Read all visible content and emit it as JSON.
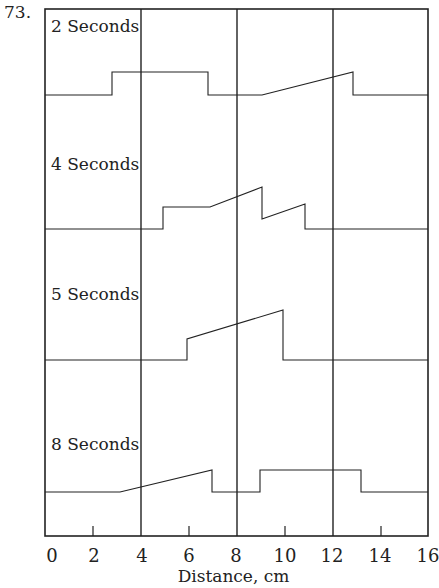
{
  "problem_number": "73.",
  "snapshots": [
    {
      "label": "2 Seconds",
      "baseline_y": 95
    },
    {
      "label": "4 Seconds",
      "baseline_y": 229
    },
    {
      "label": "5 Seconds",
      "baseline_y": 360
    },
    {
      "label": "8 Seconds",
      "baseline_y": 492
    }
  ],
  "x_axis": {
    "title": "Distance, cm",
    "ticks": [
      "0",
      "2",
      "4",
      "6",
      "8",
      "10",
      "12",
      "14",
      "16"
    ],
    "range": [
      0,
      16
    ]
  },
  "pulses_cm": {
    "2s": "square pulse 3–7 cm (height ~1 unit); triangular ramp pulse 9–13 cm rising to ~1 unit then drop",
    "4s": "square step 5–7, ramp up to 9 (peak ~1.6), drop, ramp 9–11, drop to baseline at 11",
    "5s": "ramp pulse 6–10 cm, from ~0.9 to ~1.6, then drop",
    "8s": "ramp 3–7 cm rising to ~1 unit, drop; square pulse 9–13 cm"
  }
}
